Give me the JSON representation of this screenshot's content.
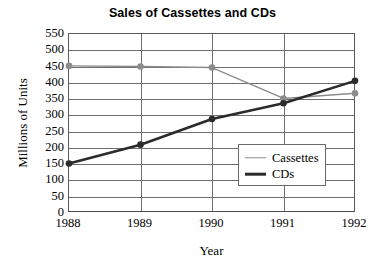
{
  "chart_data": {
    "type": "line",
    "title": "Sales of Cassettes and CDs",
    "xlabel": "Year",
    "ylabel": "Millions of Units",
    "categories": [
      "1988",
      "1989",
      "1990",
      "1991",
      "1992"
    ],
    "x": [
      1988,
      1989,
      1990,
      1991,
      1992
    ],
    "series": [
      {
        "name": "Cassettes",
        "values": [
          452,
          450,
          447,
          352,
          368
        ],
        "color": "#8c8c8c",
        "marker": "filled-circle",
        "line_width": 1.4
      },
      {
        "name": "CDs",
        "values": [
          152,
          210,
          289,
          337,
          406
        ],
        "color": "#2b2b2b",
        "marker": "filled-circle",
        "line_width": 2.6
      }
    ],
    "ylim": [
      0,
      550
    ],
    "ytick_step": 50,
    "yticks": [
      550,
      500,
      450,
      400,
      350,
      300,
      250,
      200,
      150,
      100,
      50,
      0
    ],
    "xlim": [
      1988,
      1992
    ],
    "grid": true,
    "grid_horizontal": true,
    "grid_vertical": true,
    "legend_position": "center-right",
    "legend_entries": [
      "Cassettes",
      "CDs"
    ],
    "background": "#ffffff",
    "axis_color": "#5a5a5a",
    "grid_color": "#6e6e6e"
  }
}
